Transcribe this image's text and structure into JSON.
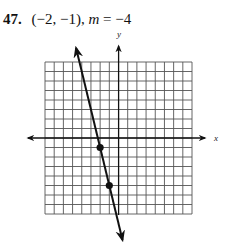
{
  "problem": {
    "number": "47.",
    "point": "(−2, −1),",
    "slope_var": "m",
    "slope_eq": " = −4"
  },
  "graph": {
    "x_axis_label": "x",
    "y_axis_label": "y",
    "grid": {
      "x_min": -8,
      "x_max": 8,
      "y_min": -8,
      "y_max": 8,
      "step": 1
    },
    "points": [
      {
        "label": "given-point",
        "x": -2,
        "y": -1
      },
      {
        "label": "second-point",
        "x": -1,
        "y": -5
      }
    ],
    "line": {
      "slope": -4,
      "through": [
        -2,
        -1
      ]
    },
    "colors": {
      "grid": "#555555",
      "axis": "#111111",
      "line": "#111111"
    }
  }
}
